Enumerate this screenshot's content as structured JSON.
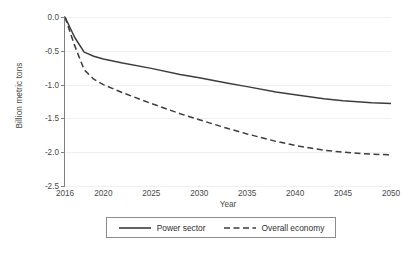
{
  "chart_data": {
    "type": "line",
    "title": "",
    "xlabel": "Year",
    "ylabel": "Billion metric tons",
    "xlim": [
      2016,
      2050
    ],
    "ylim": [
      -2.5,
      0.0
    ],
    "grid": true,
    "legend_position": "bottom",
    "x_tick_labels": [
      "2016",
      "2020",
      "2025",
      "2030",
      "2035",
      "2040",
      "2045",
      "2050"
    ],
    "x_ticks": [
      2016,
      2020,
      2025,
      2030,
      2035,
      2040,
      2045,
      2050
    ],
    "y_tick_labels": [
      "0.0",
      "-0.5",
      "-1.0",
      "-1.5",
      "-2.0",
      "-2.5"
    ],
    "y_ticks": [
      0.0,
      -0.5,
      -1.0,
      -1.5,
      -2.0,
      -2.5
    ],
    "series": [
      {
        "name": "Power sector",
        "style": "solid",
        "color": "#3d3d3d",
        "x": [
          2016,
          2017,
          2018,
          2019,
          2020,
          2022,
          2025,
          2028,
          2030,
          2033,
          2035,
          2038,
          2040,
          2043,
          2045,
          2048,
          2050
        ],
        "values": [
          0.0,
          -0.3,
          -0.52,
          -0.58,
          -0.62,
          -0.68,
          -0.76,
          -0.85,
          -0.9,
          -0.98,
          -1.03,
          -1.11,
          -1.15,
          -1.21,
          -1.24,
          -1.27,
          -1.28
        ]
      },
      {
        "name": "Overall economy",
        "style": "dashed",
        "color": "#3d3d3d",
        "x": [
          2016,
          2017,
          2018,
          2019,
          2020,
          2022,
          2025,
          2028,
          2030,
          2033,
          2035,
          2038,
          2040,
          2043,
          2045,
          2048,
          2050
        ],
        "values": [
          0.0,
          -0.42,
          -0.78,
          -0.92,
          -1.0,
          -1.12,
          -1.28,
          -1.43,
          -1.52,
          -1.65,
          -1.73,
          -1.84,
          -1.9,
          -1.97,
          -2.0,
          -2.03,
          -2.04
        ]
      }
    ]
  },
  "legend": {
    "entries": [
      {
        "label": "Power sector",
        "icon": "solid-line-icon"
      },
      {
        "label": "Overall economy",
        "icon": "dashed-line-icon"
      }
    ]
  }
}
